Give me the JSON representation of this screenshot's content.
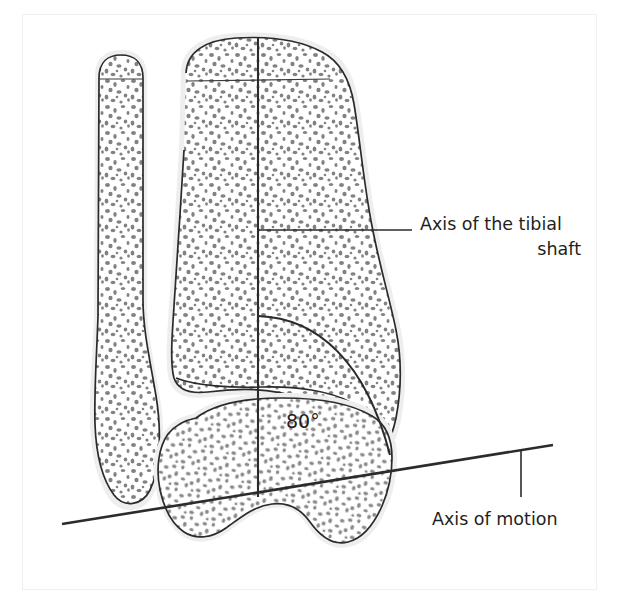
{
  "figure": {
    "background_color": "#ffffff",
    "frame_color": "#f0f0f0",
    "ink_color": "#231f20",
    "bone_fill": "#ffffff",
    "cortex_color": "#eeeeee",
    "trabecula_color": "#7d7d7d"
  },
  "labels": {
    "tibial_axis_line1": "Axis of the tibial",
    "tibial_axis_line2": "shaft",
    "motion_axis": "Axis of motion",
    "angle": "80°"
  },
  "annotations": {
    "angle_value": 80,
    "angle_unit": "degrees",
    "angle_between": [
      "Axis of the tibial shaft",
      "Axis of motion"
    ]
  },
  "structures": [
    {
      "name": "fibula",
      "side": "left"
    },
    {
      "name": "tibia",
      "side": "right"
    },
    {
      "name": "talus",
      "side": "inferior"
    }
  ]
}
